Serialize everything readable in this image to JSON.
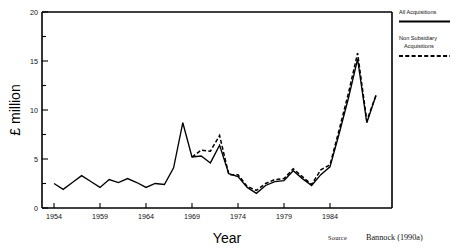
{
  "chart_data": {
    "type": "line",
    "title": "",
    "xlabel": "Year",
    "ylabel": "£ million",
    "xlim": [
      1953,
      1990
    ],
    "ylim": [
      0,
      20
    ],
    "xticks": [
      1954,
      1959,
      1964,
      1969,
      1974,
      1979,
      1984
    ],
    "xtick_labels": [
      "1954",
      "1959",
      "1964",
      "1969",
      "1974",
      "1979",
      "1984"
    ],
    "yticks": [
      0,
      5,
      10,
      15,
      20
    ],
    "ytick_labels": [
      "0",
      "5",
      "10",
      "15",
      "20"
    ],
    "yticks_minor": [
      2.5,
      7.5,
      12.5,
      17.5
    ],
    "grid": false,
    "legend_position": "outside right top",
    "x": [
      1954,
      1955,
      1956,
      1957,
      1958,
      1959,
      1960,
      1961,
      1962,
      1963,
      1964,
      1965,
      1966,
      1967,
      1968,
      1969,
      1970,
      1971,
      1972,
      1973,
      1974,
      1975,
      1976,
      1977,
      1978,
      1979,
      1980,
      1981,
      1982,
      1983,
      1984,
      1985,
      1986,
      1987,
      1988,
      1989
    ],
    "series": [
      {
        "name": "All Acquisitions",
        "style": "solid",
        "values": [
          2.5,
          1.9,
          2.6,
          3.3,
          2.7,
          2.1,
          2.9,
          2.6,
          3.0,
          2.6,
          2.1,
          2.5,
          2.4,
          4.1,
          8.7,
          5.2,
          5.3,
          4.6,
          6.4,
          3.5,
          3.2,
          2.1,
          1.5,
          2.3,
          2.7,
          2.8,
          3.8,
          3.0,
          2.3,
          3.4,
          4.2,
          7.6,
          11.2,
          15.2,
          8.7,
          11.5
        ]
      },
      {
        "name": "Non Subsidiary Acquisitions",
        "style": "dashed",
        "values": [
          null,
          null,
          null,
          null,
          null,
          null,
          null,
          null,
          null,
          null,
          null,
          null,
          null,
          null,
          null,
          5.2,
          5.9,
          5.8,
          7.4,
          3.4,
          3.4,
          2.2,
          1.8,
          2.5,
          2.9,
          3.0,
          4.0,
          3.2,
          2.4,
          3.9,
          4.4,
          8.0,
          11.7,
          15.8,
          8.9,
          11.5
        ]
      }
    ]
  },
  "legend": {
    "entries": [
      {
        "label": "All Acquisitions",
        "style": "solid"
      },
      {
        "label_line1": "Non Subsidiary",
        "label_line2": "Acquisitions",
        "style": "dashed"
      }
    ]
  },
  "source": {
    "prefix": "Source",
    "text": "Bannock (1990a)"
  },
  "axis": {
    "x_title": "Year",
    "y_title": "£ million"
  }
}
